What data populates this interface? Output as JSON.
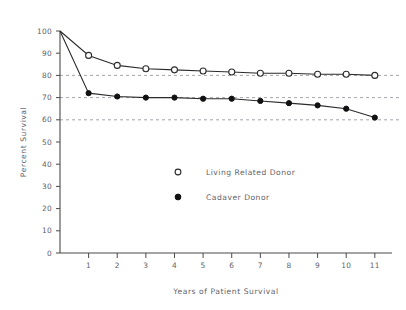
{
  "chart_data": {
    "type": "line",
    "title": "",
    "xlabel": "Years of Patient Survival",
    "ylabel": "Percent Survival",
    "xlim": [
      0,
      11.6
    ],
    "ylim": [
      0,
      100
    ],
    "grid": true,
    "gridlines_y": [
      80,
      70,
      60
    ],
    "legend_position": "center",
    "x_ticks": [
      1,
      2,
      3,
      4,
      5,
      6,
      7,
      8,
      9,
      10,
      11
    ],
    "x_tick_labels": [
      "1",
      "2",
      "3",
      "4",
      "5",
      "6",
      "7",
      "8",
      "9",
      "10",
      "11"
    ],
    "y_ticks": [
      0,
      10,
      20,
      30,
      40,
      50,
      60,
      70,
      80,
      90,
      100
    ],
    "y_tick_labels": [
      "0",
      "10",
      "20",
      "30",
      "40",
      "50",
      "60",
      "70",
      "80",
      "90",
      "100"
    ],
    "x": [
      0,
      1,
      2,
      3,
      4,
      5,
      6,
      7,
      8,
      9,
      10,
      11
    ],
    "series": [
      {
        "name": "Living Related Donor",
        "marker": "open-circle",
        "color": "#2b2b2b",
        "values": [
          100,
          89,
          84.5,
          83,
          82.5,
          82,
          81.5,
          81,
          81,
          80.5,
          80.5,
          80
        ]
      },
      {
        "name": "Cadaver Donor",
        "marker": "filled-circle",
        "color": "#111111",
        "values": [
          100,
          72,
          70.5,
          70,
          70,
          69.5,
          69.5,
          68.5,
          67.5,
          66.5,
          65,
          61
        ]
      }
    ]
  },
  "legend": {
    "entries": [
      {
        "label": "Living Related Donor",
        "marker": "open-circle"
      },
      {
        "label": "Cadaver Donor",
        "marker": "filled-circle"
      }
    ]
  }
}
